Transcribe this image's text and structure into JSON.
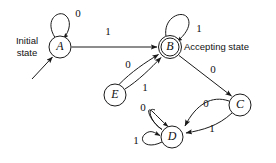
{
  "diagram": {
    "stroke_color": "#1a1a1a",
    "background_color": "#ffffff",
    "annotations": {
      "initial_state_line1": "Initial",
      "initial_state_line2": "state",
      "accepting_state": "Accepting state"
    },
    "nodes": [
      {
        "id": "A",
        "label": "A",
        "cx": 60,
        "cy": 47,
        "r": 11,
        "accepting": false
      },
      {
        "id": "B",
        "label": "B",
        "cx": 170,
        "cy": 47,
        "r": 11,
        "accepting": true
      },
      {
        "id": "E",
        "label": "E",
        "cx": 115,
        "cy": 95,
        "r": 11,
        "accepting": false
      },
      {
        "id": "C",
        "label": "C",
        "cx": 240,
        "cy": 105,
        "r": 11,
        "accepting": false
      },
      {
        "id": "D",
        "label": "D",
        "cx": 172,
        "cy": 137,
        "r": 11,
        "accepting": false
      }
    ],
    "transitions": [
      {
        "from": "A",
        "to": "A",
        "symbol": "0",
        "kind": "self-loop",
        "label_x": 78,
        "label_y": 14
      },
      {
        "from": "A",
        "to": "B",
        "symbol": "1",
        "kind": "straight",
        "label_x": 108,
        "label_y": 32
      },
      {
        "from": "B",
        "to": "B",
        "symbol": "1",
        "kind": "self-loop",
        "label_x": 199,
        "label_y": 29
      },
      {
        "from": "B",
        "to": "C",
        "symbol": "0",
        "kind": "straight",
        "label_x": 213,
        "label_y": 70
      },
      {
        "from": "E",
        "to": "B",
        "symbol": "0",
        "kind": "curve",
        "label_x": 128,
        "label_y": 65
      },
      {
        "from": "E",
        "to": "B",
        "symbol": "1",
        "kind": "curve",
        "label_x": 145,
        "label_y": 88
      },
      {
        "from": "C",
        "to": "D",
        "symbol": "0",
        "kind": "curve",
        "label_x": 206,
        "label_y": 104
      },
      {
        "from": "C",
        "to": "D",
        "symbol": "1",
        "kind": "curve",
        "label_x": 212,
        "label_y": 129
      },
      {
        "from": "D",
        "to": "D",
        "symbol": "0",
        "kind": "self-loop",
        "label_x": 143,
        "label_y": 108
      },
      {
        "from": "D",
        "to": "D",
        "symbol": "1",
        "kind": "self-loop",
        "label_x": 136,
        "label_y": 141
      }
    ],
    "start_arrow": {
      "from_x": 32,
      "from_y": 78,
      "to_x": 53,
      "to_y": 56
    }
  }
}
